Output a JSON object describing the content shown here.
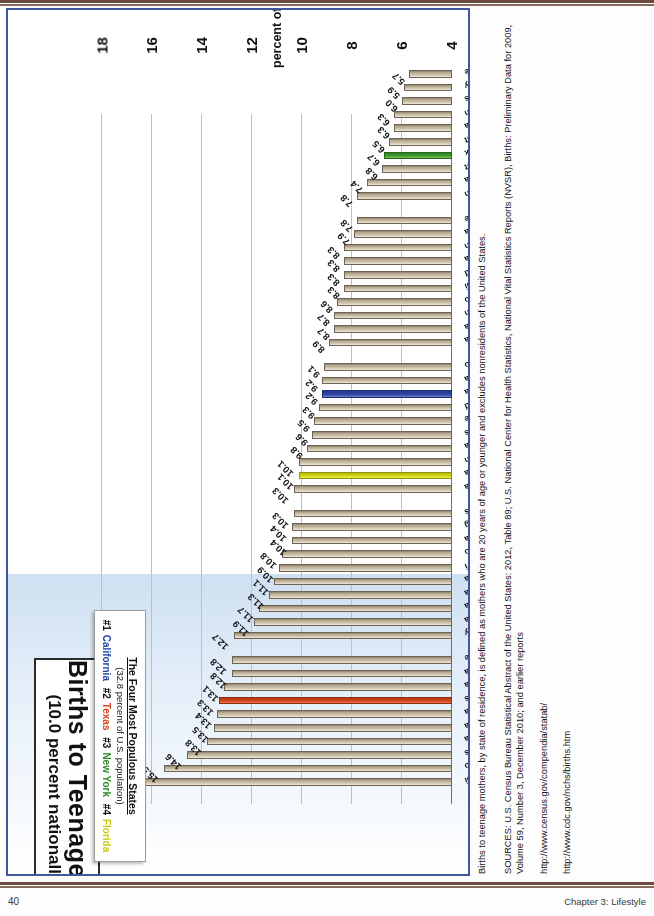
{
  "page": {
    "number": "40",
    "chapter": "Chapter 3: Lifestyle"
  },
  "chart_panel": {
    "title_line1": "Births to Teenage Mothers",
    "title_line2": "(10.0 percent nationally in 2009)",
    "legend": {
      "heading": "The Four Most Populous States",
      "subheading": "(32.8 percent of U.S. population)",
      "items": [
        {
          "rank": "#1",
          "state": "California",
          "color": "#2244aa"
        },
        {
          "rank": "#2",
          "state": "Texas",
          "color": "#d0431a"
        },
        {
          "rank": "#3",
          "state": "New York",
          "color": "#2e8b23"
        },
        {
          "rank": "#4",
          "state": "Florida",
          "color": "#c8cc14"
        }
      ]
    }
  },
  "sources": {
    "note": "Births to teenage mothers, by state of residence, is defined as mothers who are 20 years of age or younger and excludes nonresidents of the United States.",
    "citation": "SOURCES: U.S. Census Bureau Statistical Abstract of the United States: 2012, Table 89; U.S. National Center for Health Statistics, National Vital Statistics Reports (NVSR), Births: Preliminary Data for 2009, Volume 59, Number 3, December 2010; and earlier reports",
    "url1": "http://www.census.gov/compendia/statab/",
    "url2": "http://www.cdc.gov/nchs/births.htm"
  },
  "chart_data": {
    "type": "bar",
    "orientation": "horizontal",
    "title": "Births to Teenage Mothers (10.0 percent nationally in 2009)",
    "xlabel": "",
    "ylabel": "percent of all births",
    "ylim": [
      4,
      18
    ],
    "yticks": [
      4,
      6,
      8,
      10,
      12,
      14,
      16,
      18
    ],
    "grid": true,
    "legend_position": "top-left",
    "national_average": 10.0,
    "categories": [
      "Mississippi",
      "New Mexico",
      "Arkansas",
      "Oklahoma",
      "West Virginia",
      "Alabama",
      "Texas",
      "Louisiana",
      "South Carolina",
      "Tennessee",
      "Kentucky",
      "Arizona",
      "Georgia",
      "North Carolina",
      "Indiana",
      "Missouri",
      "Ohio",
      "Nevada",
      "Wyoming",
      "Kansas",
      "Montana",
      "Florida",
      "Michigan",
      "Alaska",
      "Illinois",
      "Delaware",
      "Rhode Island",
      "California",
      "South Dakota",
      "Colorado",
      "Pennsylvania",
      "Iowa",
      "Oregon",
      "Idaho",
      "Hawaii",
      "Maryland",
      "Nebraska",
      "Wisconsin",
      "Virginia",
      "Maine",
      "Washington",
      "North Dakota",
      "Connecticut",
      "New York",
      "Vermont",
      "Minnesota",
      "Utah",
      "Massachusetts",
      "New Jersey",
      "New Hampshire"
    ],
    "values": [
      16.5,
      15.5,
      14.6,
      13.8,
      13.5,
      13.4,
      13.3,
      13.1,
      12.8,
      12.8,
      12.7,
      11.9,
      11.7,
      11.3,
      11.1,
      10.9,
      10.8,
      10.4,
      10.4,
      10.3,
      10.3,
      10.1,
      10.1,
      9.8,
      9.6,
      9.5,
      9.3,
      9.2,
      9.2,
      9.1,
      8.9,
      8.7,
      8.7,
      8.6,
      8.3,
      8.3,
      8.3,
      8.3,
      7.9,
      7.8,
      7.8,
      7.4,
      6.8,
      6.7,
      6.5,
      6.3,
      6.3,
      6.0,
      5.9,
      5.7
    ],
    "highlights": {
      "California": "#2e44a0",
      "Texas": "#d1431a",
      "New York": "#3d9a2c",
      "Florida": "#cfd614"
    },
    "default_bar_color": "#b5a88f",
    "group_breaks_after": [
      "Tennessee",
      "Kansas",
      "Colorado",
      "Maine"
    ]
  }
}
